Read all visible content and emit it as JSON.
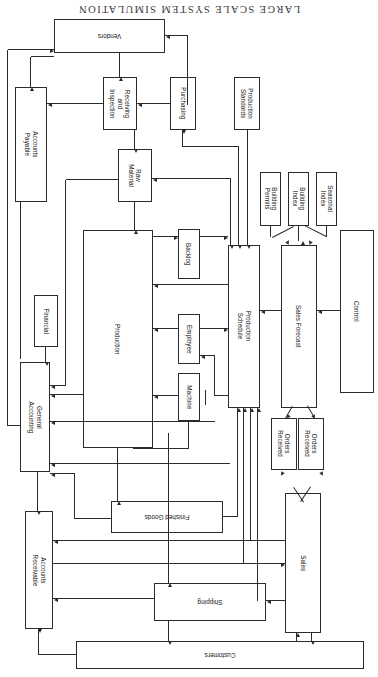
{
  "figure": {
    "title": "LARGE SCALE SYSTEM SIMULATION",
    "orientation": "rotated-180",
    "type": "block-flow-diagram"
  },
  "nodes": {
    "vendors": "Vendors",
    "production_standards": "Production Standards",
    "purchasing": "Purchasing",
    "receiving_and_inspection": "Receiving and Inspection",
    "accounts_payable": "Accounts Payable",
    "raw_material": "Raw Material",
    "seasonal_index": "Seasonal Index",
    "building_index": "Building Index",
    "building_permits": "Building Permits",
    "control": "Control",
    "sales_forecast": "Sales Forecast",
    "production_schedule": "Production Schedule",
    "backlog": "Backlog",
    "employee": "Employee",
    "machine": "Machine",
    "production": "Production",
    "financial": "Financial",
    "general_accounting": "General Accounting",
    "orders_received_1": "Orders Received",
    "orders_received_2": "Orders Received",
    "sales": "Sales",
    "finished_goods": "Finished Goods",
    "accounts_receivable": "Accounts Receivable",
    "shipping": "Shipping",
    "customers": "Customers"
  },
  "colors": {
    "ink": "#2b2b2b",
    "paper": "#ffffff",
    "title": "#3a3a3a"
  }
}
